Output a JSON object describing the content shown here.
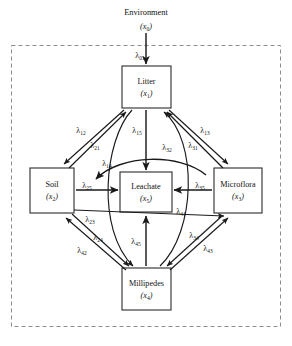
{
  "figure": {
    "type": "compartment-flow-diagram",
    "boundary": {
      "style": "dashed",
      "label": "system-boundary"
    }
  },
  "external": {
    "name": "Environment",
    "variable": "x",
    "subscript": "0"
  },
  "compartments": [
    {
      "id": "litter",
      "name": "Litter",
      "variable": "x",
      "subscript": "1"
    },
    {
      "id": "soil",
      "name": "Soil",
      "variable": "x",
      "subscript": "2"
    },
    {
      "id": "microflora",
      "name": "Microflora",
      "variable": "x",
      "subscript": "3"
    },
    {
      "id": "millipedes",
      "name": "Millipedes",
      "variable": "x",
      "subscript": "4"
    },
    {
      "id": "leachate",
      "name": "Leachate",
      "variable": "x",
      "subscript": "5"
    }
  ],
  "flows": [
    {
      "id": "l01",
      "symbol": "λ",
      "subscript": "01",
      "from": "environment",
      "to": "litter"
    },
    {
      "id": "l12",
      "symbol": "λ",
      "subscript": "12",
      "from": "litter",
      "to": "soil"
    },
    {
      "id": "l21",
      "symbol": "λ",
      "subscript": "21",
      "from": "soil",
      "to": "litter"
    },
    {
      "id": "l13",
      "symbol": "λ",
      "subscript": "13",
      "from": "litter",
      "to": "microflora"
    },
    {
      "id": "l31",
      "symbol": "λ",
      "subscript": "31",
      "from": "microflora",
      "to": "litter"
    },
    {
      "id": "l15",
      "symbol": "λ",
      "subscript": "15",
      "from": "litter",
      "to": "leachate"
    },
    {
      "id": "l14",
      "symbol": "λ",
      "subscript": "14",
      "from": "litter",
      "to": "millipedes"
    },
    {
      "id": "l32",
      "symbol": "λ",
      "subscript": "32",
      "from": "microflora",
      "to": "litter"
    },
    {
      "id": "l25",
      "symbol": "λ",
      "subscript": "25",
      "from": "soil",
      "to": "leachate"
    },
    {
      "id": "l35",
      "symbol": "λ",
      "subscript": "35",
      "from": "microflora",
      "to": "leachate"
    },
    {
      "id": "l23",
      "symbol": "λ",
      "subscript": "23",
      "from": "soil",
      "to": "microflora"
    },
    {
      "id": "l24",
      "symbol": "λ",
      "subscript": "24",
      "from": "soil",
      "to": "millipedes"
    },
    {
      "id": "l42",
      "symbol": "λ",
      "subscript": "42",
      "from": "millipedes",
      "to": "soil"
    },
    {
      "id": "l34",
      "symbol": "λ",
      "subscript": "34",
      "from": "microflora",
      "to": "millipedes"
    },
    {
      "id": "l43",
      "symbol": "λ",
      "subscript": "43",
      "from": "millipedes",
      "to": "microflora"
    },
    {
      "id": "l41",
      "symbol": "λ",
      "subscript": "41",
      "from": "millipedes",
      "to": "litter"
    },
    {
      "id": "l45",
      "symbol": "λ",
      "subscript": "45",
      "from": "millipedes",
      "to": "leachate"
    }
  ],
  "colors": {
    "box_stroke": "#2b2b2b",
    "line": "#1a1a1a",
    "boundary": "#8d8d8d",
    "background": "#ffffff",
    "text": "#111111"
  }
}
